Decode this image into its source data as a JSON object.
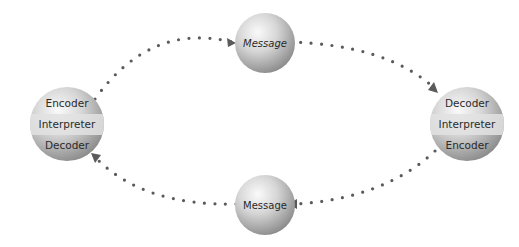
{
  "diagram": {
    "type": "communication-cycle",
    "nodes": [
      {
        "id": "left-party",
        "bands": [
          "Encoder",
          "Interpreter",
          "Decoder"
        ]
      },
      {
        "id": "top-message",
        "label": "Message"
      },
      {
        "id": "right-party",
        "bands": [
          "Decoder",
          "Interpreter",
          "Encoder"
        ]
      },
      {
        "id": "bottom-message",
        "label": "Message"
      }
    ],
    "edges": [
      {
        "from": "left-party",
        "to": "top-message",
        "style": "dotted",
        "arrow": "end"
      },
      {
        "from": "top-message",
        "to": "right-party",
        "style": "dotted",
        "arrow": "end"
      },
      {
        "from": "right-party",
        "to": "bottom-message",
        "style": "dotted",
        "arrow": "end"
      },
      {
        "from": "bottom-message",
        "to": "left-party",
        "style": "dotted",
        "arrow": "end"
      }
    ],
    "colors": {
      "dots": "#5a5a5a",
      "sphere_light": "#f4f4f4",
      "sphere_dark": "#8e8e8e",
      "band": "#dcdcdc",
      "text": "#2a2a2a"
    }
  },
  "left": {
    "top": "Encoder",
    "middle": "Interpreter",
    "bottom": "Decoder"
  },
  "right": {
    "top": "Decoder",
    "middle": "Interpreter",
    "bottom": "Encoder"
  },
  "top_message": {
    "label": "Message"
  },
  "bottom_message": {
    "label": "Message"
  }
}
